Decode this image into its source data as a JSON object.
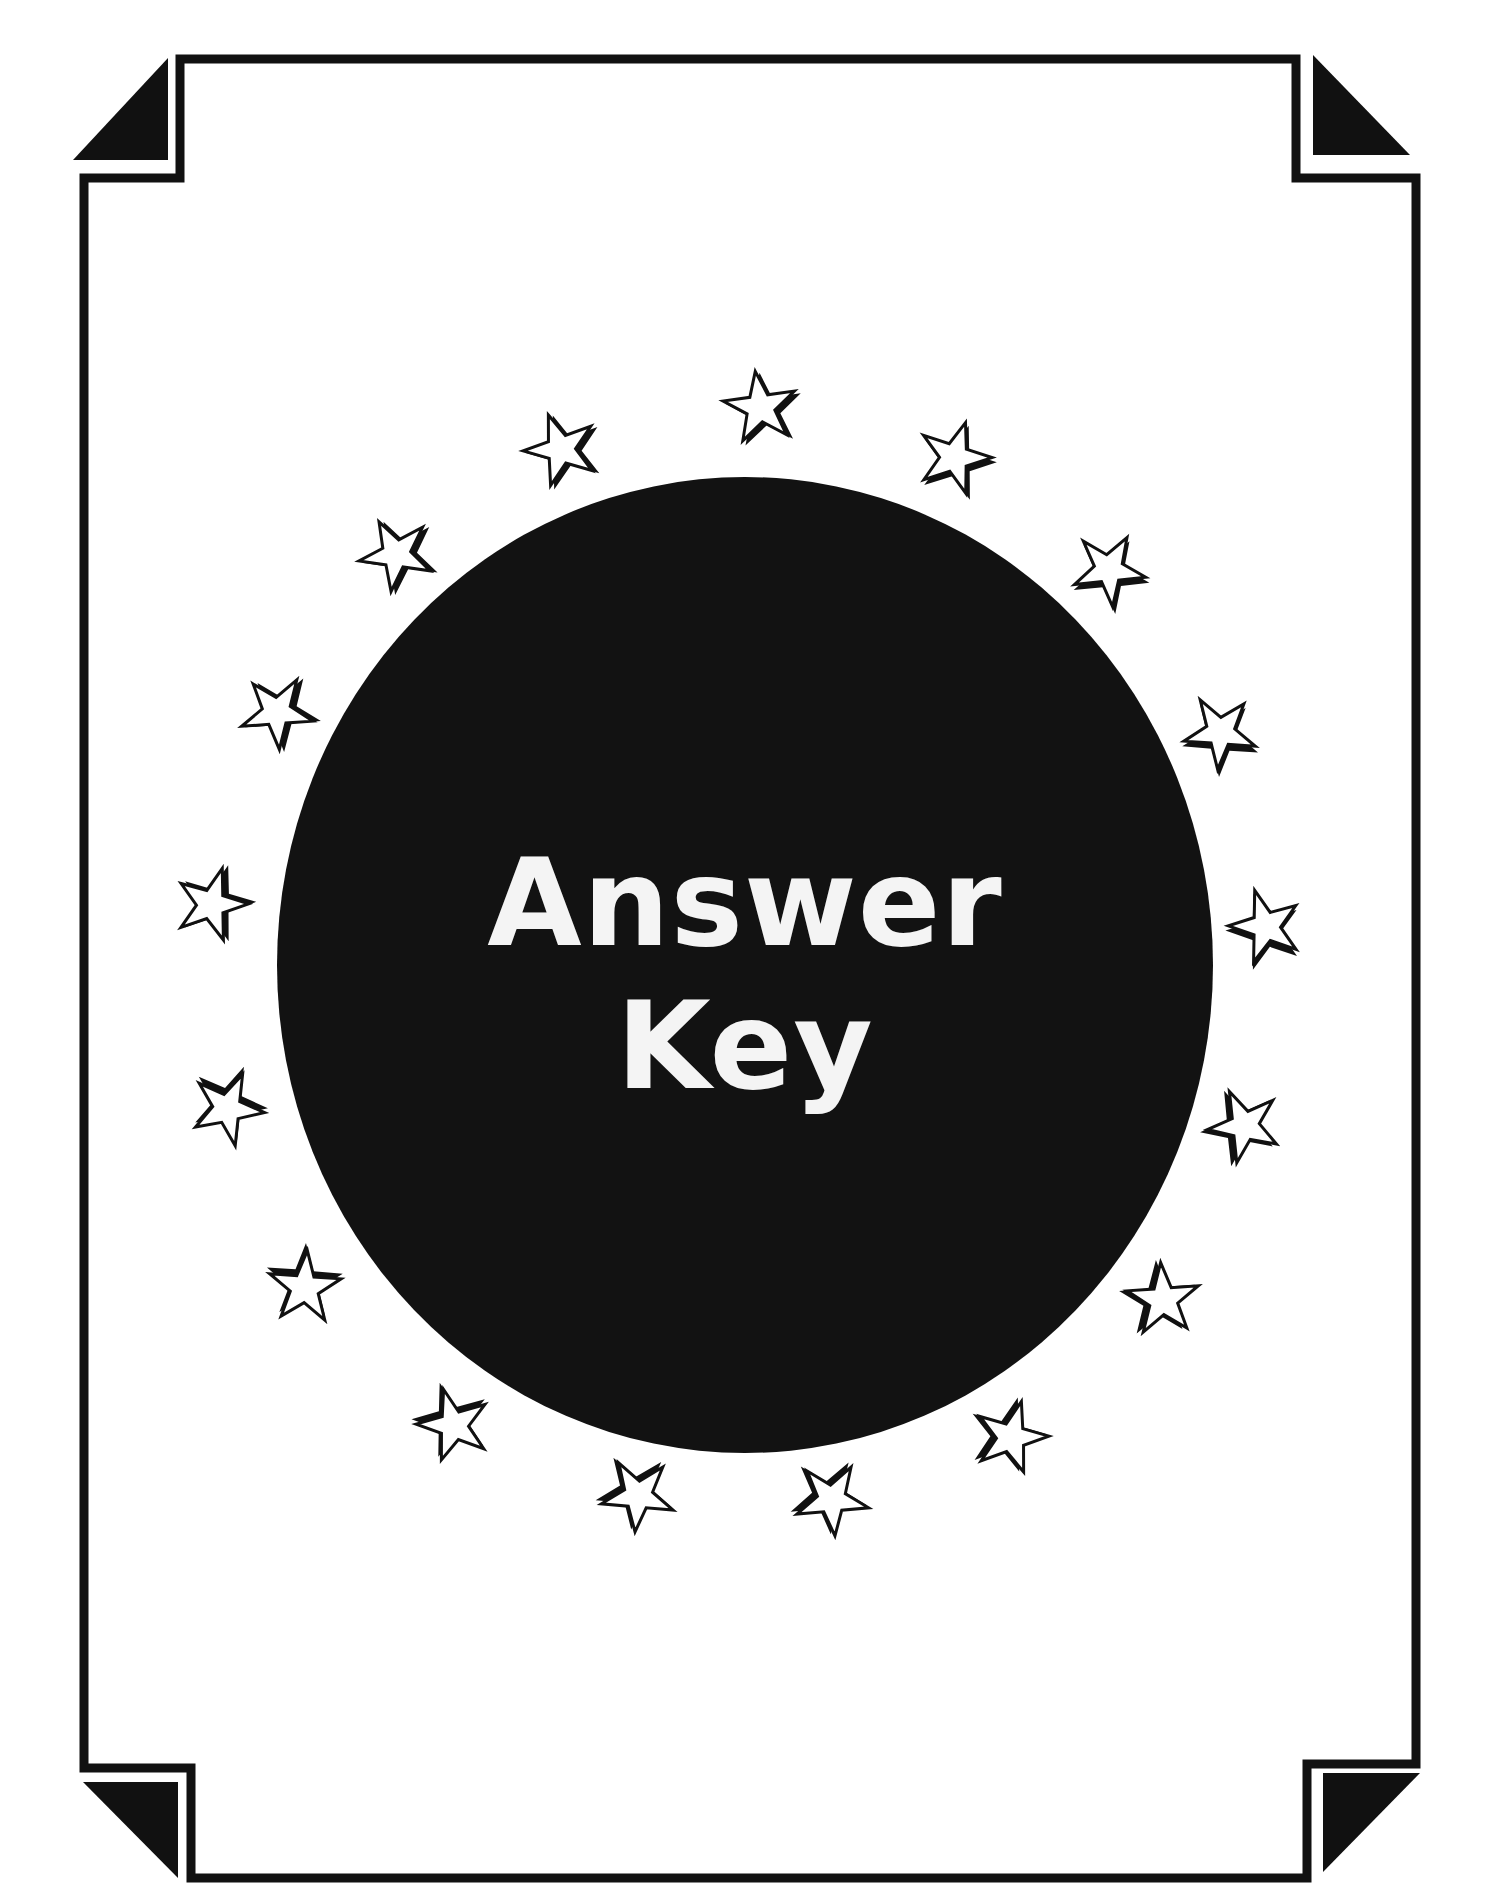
{
  "page": {
    "title_line1": "Answer",
    "title_line2": "Key"
  },
  "colors": {
    "ink": "#111111",
    "paper": "#ffffff",
    "text_on_dark": "#f4f4f4"
  },
  "decor": {
    "circle": {
      "cx": 745,
      "cy": 965,
      "rx": 468,
      "ry": 488
    },
    "star_count": 18
  }
}
